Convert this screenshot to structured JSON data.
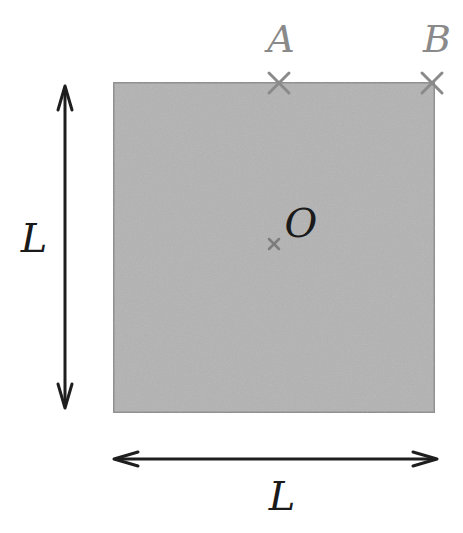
{
  "diagram": {
    "type": "square-plate",
    "square": {
      "x": 113,
      "y": 82,
      "width": 322,
      "height": 331,
      "fill": "#b3b3b3",
      "stroke": "#8c8c8c"
    },
    "points": [
      {
        "id": "A",
        "label": "A",
        "x": 279,
        "y": 83,
        "label_x": 281,
        "label_y": 52,
        "color": "#8a8a8a"
      },
      {
        "id": "B",
        "label": "B",
        "x": 432,
        "y": 83,
        "label_x": 437,
        "label_y": 52,
        "color": "#8a8a8a"
      },
      {
        "id": "O",
        "label": "O",
        "x": 274,
        "y": 244,
        "label_x": 300,
        "label_y": 237,
        "color": "#222222"
      }
    ],
    "dimensions": {
      "vertical": {
        "label": "L",
        "x": 65,
        "y1": 86,
        "y2": 408,
        "label_x": 37,
        "label_y": 245
      },
      "horizontal": {
        "label": "L",
        "y": 459,
        "x1": 114,
        "x2": 437,
        "label_x": 282,
        "label_y": 507
      }
    },
    "colors": {
      "arrow": "#1e1e1e",
      "label_dark": "#1a1a1a",
      "label_light": "#8a8a8a"
    }
  }
}
